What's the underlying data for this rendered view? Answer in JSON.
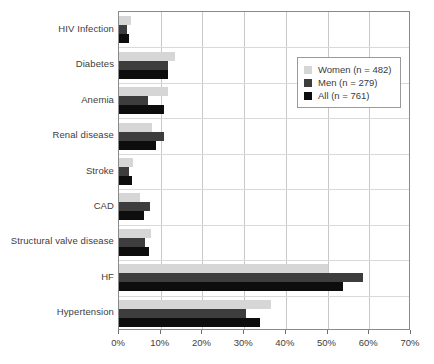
{
  "chart_data": {
    "type": "bar",
    "orientation": "horizontal",
    "title": "",
    "xlabel": "",
    "ylabel": "",
    "xlim": [
      0,
      70
    ],
    "xunit": "%",
    "xticks": [
      "0%",
      "10%",
      "20%",
      "30%",
      "40%",
      "50%",
      "60%",
      "70%"
    ],
    "xtick_values": [
      0,
      10,
      20,
      30,
      40,
      50,
      60,
      70
    ],
    "grid": true,
    "legend_position": "upper right",
    "categories": [
      "HIV Infection",
      "Diabetes",
      "Anemia",
      "Renal disease",
      "Stroke",
      "CAD",
      "Structural valve disease",
      "HF",
      "Hypertension"
    ],
    "series": [
      {
        "name": "Women (n = 482)",
        "key": "women",
        "color": "#d6d6d6",
        "values": [
          2.8,
          13.5,
          11.7,
          7.8,
          3.3,
          5.0,
          7.7,
          50.0,
          36.4
        ]
      },
      {
        "name": "Men (n = 279)",
        "key": "men",
        "color": "#3d3d3d",
        "values": [
          1.8,
          11.8,
          7.0,
          10.8,
          2.5,
          7.5,
          6.3,
          58.6,
          30.5
        ]
      },
      {
        "name": "All (n = 761)",
        "key": "all",
        "color": "#0d0d0d",
        "values": [
          2.5,
          11.8,
          10.7,
          8.9,
          3.0,
          6.0,
          7.3,
          53.7,
          33.8
        ]
      }
    ]
  },
  "legend": {
    "items": [
      {
        "label": "Women (n = 482)",
        "key": "women"
      },
      {
        "label": "Men (n = 279)",
        "key": "men"
      },
      {
        "label": "All (n = 761)",
        "key": "all"
      }
    ]
  },
  "caption": ""
}
